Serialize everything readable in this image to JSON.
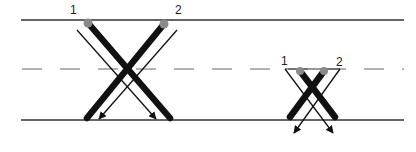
{
  "diagram": {
    "lines": {
      "top_y": 20,
      "middle_dashed_y": 69,
      "bottom_y": 120,
      "x_start": 21,
      "x_end": 404,
      "color": "#333333",
      "dash_color": "#888888"
    },
    "large_cross": {
      "label_1": "1",
      "label_2": "2",
      "label_1_pos": [
        70,
        14
      ],
      "label_2_pos": [
        172,
        14
      ],
      "dot_1": [
        88,
        23
      ],
      "dot_2": [
        164,
        24
      ],
      "bar_1_end": [
        170,
        118
      ],
      "bar_2_end": [
        87,
        118
      ],
      "arrow_1": {
        "from": [
          77,
          30
        ],
        "to": [
          156,
          119
        ]
      },
      "arrow_2": {
        "from": [
          177,
          30
        ],
        "to": [
          99,
          119
        ]
      }
    },
    "small_cross": {
      "label_1": "1",
      "label_2": "2",
      "label_1_pos": [
        282,
        65
      ],
      "label_2_pos": [
        336,
        65
      ],
      "dot_1": [
        300,
        71
      ],
      "dot_2": [
        324,
        71
      ],
      "bar_1_end": [
        335,
        117
      ],
      "bar_2_end": [
        290,
        117
      ],
      "arrow_1": {
        "from": [
          285,
          69
        ],
        "to": [
          333,
          133
        ]
      },
      "arrow_2": {
        "from": [
          340,
          69
        ],
        "to": [
          294,
          133
        ]
      }
    },
    "colors": {
      "bar": "#111111",
      "dot": "#8a8a8a",
      "arrow": "#111111"
    }
  }
}
